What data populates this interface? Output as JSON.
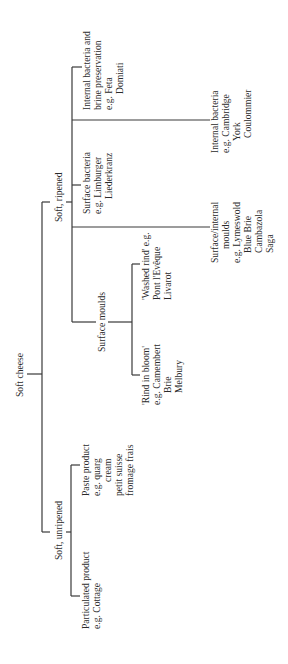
{
  "diagram": {
    "type": "tree",
    "orientation": "rotated -90deg",
    "root": {
      "label": "Soft cheese",
      "children": [
        {
          "label": "Soft, ripened",
          "children": [
            {
              "lines": [
                "Internal bacteria and",
                "brine preservation",
                "e.g. Feta",
                "Domiati"
              ]
            },
            {
              "lines": [
                "Internal bacteria",
                "e.g. Cambridge",
                "York",
                "Coulommier"
              ]
            },
            {
              "lines": [
                "Surface bacteria",
                "e.g. Limburger",
                "Liederkranz"
              ]
            },
            {
              "lines": [
                "Surface/internal",
                "moulds",
                "e.g. Lymeswold",
                "Blue Brie",
                "Cambazola",
                "Saga"
              ]
            },
            {
              "label": "Surface moulds",
              "children": [
                {
                  "lines": [
                    "'Washed rind' e.g.",
                    "Pont l'Evêque",
                    "Livarot"
                  ]
                },
                {
                  "lines": [
                    "'Rind in bloom'",
                    "e.g. Camembert",
                    "Brie",
                    "Melbury"
                  ]
                }
              ]
            }
          ]
        },
        {
          "label": "Soft, unripened",
          "children": [
            {
              "lines": [
                "Paste product",
                "e.g. quarg",
                "cream",
                "petit suisse",
                "fromage frais"
              ]
            },
            {
              "lines": [
                "Particulated product",
                "e.g. Cottage"
              ]
            }
          ]
        }
      ]
    }
  }
}
